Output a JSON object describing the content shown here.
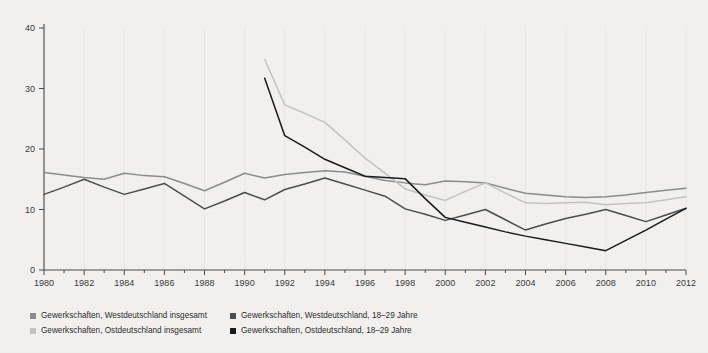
{
  "chart_data": {
    "type": "line",
    "title": "",
    "xlabel": "",
    "ylabel": "",
    "xlim": [
      1980,
      2012
    ],
    "ylim": [
      0,
      40
    ],
    "yticks": [
      0,
      10,
      20,
      30,
      40
    ],
    "xticks": [
      1980,
      1982,
      1984,
      1986,
      1988,
      1990,
      1992,
      1994,
      1996,
      1998,
      2000,
      2002,
      2004,
      2006,
      2008,
      2010,
      2012
    ],
    "xtick_labels": [
      "1980",
      "1982",
      "1984",
      "1986",
      "1988",
      "1990",
      "1992",
      "1994",
      "1996",
      "1998",
      "2000",
      "2002",
      "2004",
      "2006",
      "2008",
      "2010",
      "2012"
    ],
    "ytick_labels": [
      "0",
      "10",
      "20",
      "30",
      "40"
    ],
    "minor_xticks_every": 1,
    "grid": "vertical-light",
    "legend_position": "below-left",
    "series": [
      {
        "name": "Gewerkschaften, Westdeutschland insgesamt",
        "color": "#8c8c8c",
        "x": [
          1980,
          1981,
          1982,
          1983,
          1984,
          1985,
          1986,
          1987,
          1988,
          1989,
          1990,
          1991,
          1992,
          1993,
          1994,
          1995,
          1996,
          1997,
          1998,
          1999,
          2000,
          2001,
          2002,
          2003,
          2004,
          2005,
          2006,
          2007,
          2008,
          2009,
          2010,
          2011,
          2012
        ],
        "values": [
          16.1,
          15.7,
          15.3,
          15.0,
          16.0,
          15.6,
          15.4,
          14.3,
          13.1,
          14.5,
          16.0,
          15.2,
          15.8,
          16.1,
          16.4,
          16.2,
          15.5,
          14.8,
          14.4,
          14.1,
          14.7,
          14.6,
          14.4,
          13.5,
          12.7,
          12.4,
          12.1,
          12.0,
          12.1,
          12.4,
          12.8,
          13.2,
          13.5
        ]
      },
      {
        "name": "Gewerkschaften, Ostdeutschland insgesamt",
        "color": "#c3c3c1",
        "x": [
          1991,
          1992,
          1993,
          1994,
          1995,
          1996,
          1997,
          1998,
          1999,
          2000,
          2001,
          2002,
          2003,
          2004,
          2005,
          2006,
          2007,
          2008,
          2009,
          2010,
          2011,
          2012
        ],
        "values": [
          34.8,
          27.3,
          25.9,
          24.4,
          21.5,
          18.5,
          16.0,
          13.4,
          12.4,
          11.5,
          13.0,
          14.4,
          12.7,
          11.1,
          11.0,
          11.1,
          11.2,
          10.8,
          11.0,
          11.1,
          11.6,
          12.1
        ]
      },
      {
        "name": "Gewerkschaften, Westdeutschland, 18–29 Jahre",
        "color": "#4d4d4d",
        "x": [
          1980,
          1981,
          1982,
          1983,
          1984,
          1985,
          1986,
          1987,
          1988,
          1989,
          1990,
          1991,
          1992,
          1993,
          1994,
          1995,
          1996,
          1997,
          1998,
          1999,
          2000,
          2001,
          2002,
          2003,
          2004,
          2005,
          2006,
          2007,
          2008,
          2009,
          2010,
          2011,
          2012
        ],
        "values": [
          12.5,
          13.7,
          15.0,
          13.7,
          12.5,
          13.4,
          14.3,
          12.2,
          10.1,
          11.4,
          12.8,
          11.6,
          13.3,
          14.2,
          15.2,
          14.2,
          13.2,
          12.2,
          10.1,
          9.2,
          8.2,
          9.1,
          10.0,
          8.3,
          6.6,
          7.6,
          8.5,
          9.2,
          10.0,
          9.0,
          8.0,
          9.1,
          10.2
        ]
      },
      {
        "name": "Gewerkschaften, Ostdeutschland, 18–29 Jahre",
        "color": "#1a1a1a",
        "x": [
          1991,
          1992,
          1993,
          1994,
          1995,
          1996,
          1997,
          1998,
          1999,
          2000,
          2001,
          2002,
          2003,
          2004,
          2005,
          2006,
          2007,
          2008,
          2009,
          2010,
          2011,
          2012
        ],
        "values": [
          31.7,
          22.2,
          20.3,
          18.3,
          16.9,
          15.5,
          15.3,
          15.1,
          11.8,
          8.7,
          7.9,
          7.1,
          6.3,
          5.6,
          5.0,
          4.4,
          3.8,
          3.2,
          4.9,
          6.6,
          8.4,
          10.2
        ]
      }
    ]
  },
  "legend": {
    "items": [
      {
        "label": "Gewerkschaften, Westdeutschland insgesamt",
        "color": "#8c8c8c"
      },
      {
        "label": "Gewerkschaften, Westdeutschland, 18–29 Jahre",
        "color": "#4d4d4d"
      },
      {
        "label": "Gewerkschaften, Ostdeutschland insgesamt",
        "color": "#c3c3c1"
      },
      {
        "label": "Gewerkschaften, Ostdeutschland, 18–29 Jahre",
        "color": "#1a1a1a"
      }
    ]
  },
  "colors": {
    "background": "#f2f1ef",
    "axis": "#4a4a4a",
    "gridline": "#e8e7e4",
    "text": "#2b2b2b"
  }
}
